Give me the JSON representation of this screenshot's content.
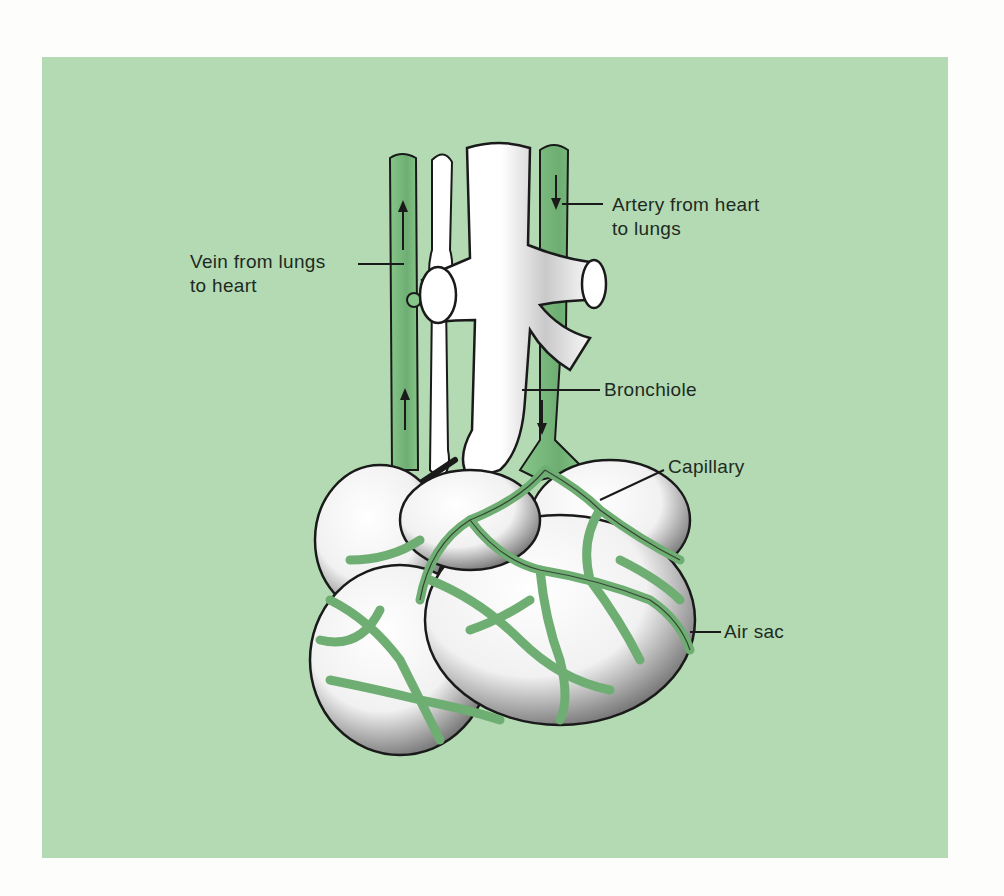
{
  "figure": {
    "background_color": "#b3dab3",
    "vessel_color": "#7cbf7e",
    "tissue_color": "#ffffff",
    "outline_color": "#1a1a1a"
  },
  "labels": {
    "vein": {
      "line1": "Vein from lungs",
      "line2": "to heart"
    },
    "artery": {
      "line1": "Artery from heart",
      "line2": "to lungs"
    },
    "bronchiole": {
      "text": "Bronchiole"
    },
    "capillary": {
      "text": "Capillary"
    },
    "air_sac": {
      "text": "Air sac"
    }
  },
  "flow_arrows": {
    "vein_direction": "up",
    "artery_direction": "down"
  }
}
